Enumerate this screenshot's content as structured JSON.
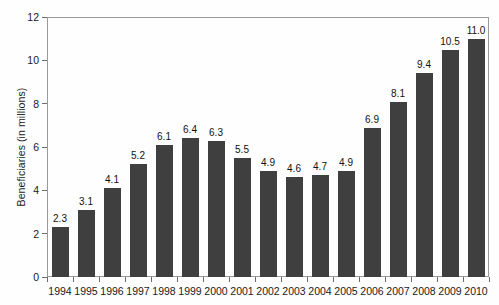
{
  "chart_data": {
    "type": "bar",
    "title": "",
    "subtitle": "",
    "xlabel": "",
    "ylabel": "Beneficiaries (in millions)",
    "categories": [
      "1994",
      "1995",
      "1996",
      "1997",
      "1998",
      "1999",
      "2000",
      "2001",
      "2002",
      "2003",
      "2004",
      "2005",
      "2006",
      "2007",
      "2008",
      "2009",
      "2010"
    ],
    "values": [
      2.3,
      3.1,
      4.1,
      5.2,
      6.1,
      6.4,
      6.3,
      5.5,
      4.9,
      4.6,
      4.7,
      4.9,
      6.9,
      8.1,
      9.4,
      10.5,
      11.0
    ],
    "data_labels": [
      "2.3",
      "3.1",
      "4.1",
      "5.2",
      "6.1",
      "6.4",
      "6.3",
      "5.5",
      "4.9",
      "4.6",
      "4.7",
      "4.9",
      "6.9",
      "8.1",
      "9.4",
      "10.5",
      "11.0"
    ],
    "ylim": [
      0,
      12
    ],
    "yticks": [
      0,
      2,
      4,
      6,
      8,
      10,
      12
    ],
    "ytick_labels": [
      "0",
      "2",
      "4",
      "6",
      "8",
      "10",
      "12"
    ],
    "grid": false,
    "legend": null,
    "legend_position": "none",
    "bar_color": "#3f3f3f",
    "frame_color": "#9a9a9a",
    "background_color": "#fefefe",
    "text_color": "#1a1a1a"
  }
}
